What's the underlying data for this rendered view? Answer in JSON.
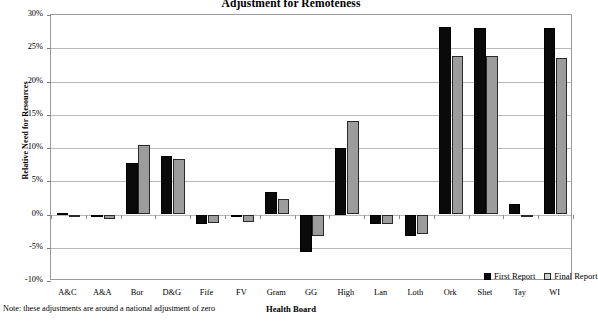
{
  "chart_data": {
    "type": "bar",
    "title": "Adjustment for Remoteness",
    "xlabel": "Health Board",
    "ylabel": "Relative Need for Resources",
    "note": "Note: these adjustments are around a national adjustment of zero",
    "ylim": [
      -10,
      30
    ],
    "ytick_labels": [
      "30%",
      "25%",
      "20%",
      "15%",
      "10%",
      "5%",
      "0%",
      "-5%",
      "-10%"
    ],
    "ytick_values": [
      30,
      25,
      20,
      15,
      10,
      5,
      0,
      -5,
      -10
    ],
    "grid": true,
    "legend_position": "inside-bottom-right",
    "categories": [
      "A&C",
      "A&A",
      "Bor",
      "D&G",
      "Fife",
      "FV",
      "Gram",
      "GG",
      "High",
      "Lan",
      "Loth",
      "Ork",
      "Shet",
      "Tay",
      "WI"
    ],
    "series": [
      {
        "name": "First Report",
        "color": "#0a0a0a",
        "values": [
          0.3,
          -0.1,
          7.7,
          8.8,
          -1.5,
          -0.2,
          3.4,
          -5.7,
          10.0,
          -1.5,
          -3.3,
          28.2,
          28.1,
          1.6,
          28.1
        ]
      },
      {
        "name": "Final Report",
        "color": "#9c9c9c",
        "values": [
          0.0,
          -0.7,
          10.5,
          8.4,
          -1.3,
          -1.2,
          2.4,
          -3.3,
          14.0,
          -1.5,
          -2.9,
          23.8,
          23.8,
          -0.3,
          23.6
        ]
      }
    ]
  }
}
